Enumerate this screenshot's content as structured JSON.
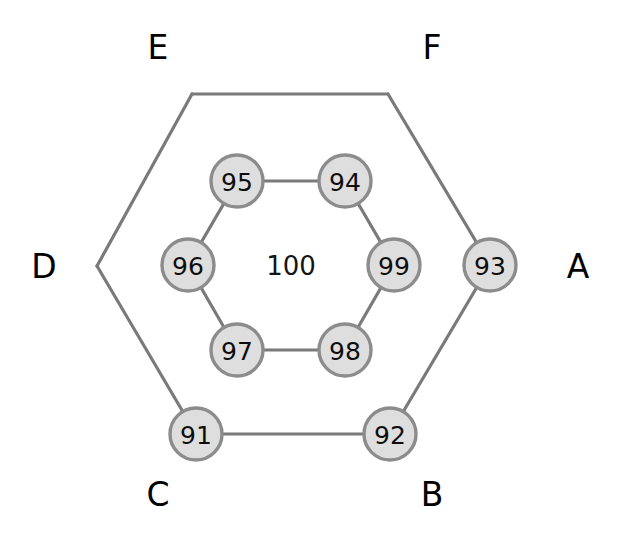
{
  "figure": {
    "title": "",
    "background_color": "#ffffff",
    "node_fill_color": "#dedede",
    "node_stroke_color": "#8c8c8c",
    "edge_color": "#7a7a7a",
    "label_color": "#000000"
  },
  "chart_data": {
    "type": "diagram",
    "layout": "nested-hexagon-graph",
    "title": "",
    "nodes": [
      {
        "id": "n91",
        "label": "91",
        "x": 196,
        "y": 434,
        "r": 26,
        "ring": "outer",
        "vertex": "C"
      },
      {
        "id": "n92",
        "label": "92",
        "x": 390,
        "y": 434,
        "r": 26,
        "ring": "outer",
        "vertex": "B"
      },
      {
        "id": "n93",
        "label": "93",
        "x": 490,
        "y": 265,
        "r": 26,
        "ring": "outer",
        "vertex": "A"
      },
      {
        "id": "n94",
        "label": "94",
        "x": 345,
        "y": 181,
        "r": 26,
        "ring": "inner",
        "vertex": ""
      },
      {
        "id": "n95",
        "label": "95",
        "x": 237,
        "y": 181,
        "r": 26,
        "ring": "inner",
        "vertex": ""
      },
      {
        "id": "n96",
        "label": "96",
        "x": 188,
        "y": 265,
        "r": 26,
        "ring": "inner",
        "vertex": ""
      },
      {
        "id": "n97",
        "label": "97",
        "x": 237,
        "y": 350,
        "r": 26,
        "ring": "inner",
        "vertex": ""
      },
      {
        "id": "n98",
        "label": "98",
        "x": 345,
        "y": 350,
        "r": 26,
        "ring": "inner",
        "vertex": ""
      },
      {
        "id": "n99",
        "label": "99",
        "x": 394,
        "y": 265,
        "r": 26,
        "ring": "inner",
        "vertex": ""
      }
    ],
    "center_node": {
      "id": "n100",
      "label": "100",
      "x": 291,
      "y": 266,
      "has_circle": false
    },
    "outer_vertices": [
      {
        "name": "A",
        "x": 490,
        "y": 265,
        "has_node": true
      },
      {
        "name": "B",
        "x": 390,
        "y": 434,
        "has_node": true
      },
      {
        "name": "C",
        "x": 196,
        "y": 434,
        "has_node": true
      },
      {
        "name": "D",
        "x": 97,
        "y": 266,
        "has_node": false
      },
      {
        "name": "E",
        "x": 192,
        "y": 94,
        "has_node": false
      },
      {
        "name": "F",
        "x": 388,
        "y": 94,
        "has_node": false
      }
    ],
    "corner_labels": [
      {
        "text": "A",
        "x": 578,
        "y": 266
      },
      {
        "text": "B",
        "x": 432,
        "y": 494
      },
      {
        "text": "C",
        "x": 158,
        "y": 494
      },
      {
        "text": "D",
        "x": 44,
        "y": 266
      },
      {
        "text": "E",
        "x": 158,
        "y": 47
      },
      {
        "text": "F",
        "x": 432,
        "y": 47
      }
    ],
    "outer_edges": [
      {
        "from": "A",
        "to": "B",
        "x1": 490,
        "y1": 265,
        "x2": 390,
        "y2": 434
      },
      {
        "from": "B",
        "to": "C",
        "x1": 390,
        "y1": 434,
        "x2": 196,
        "y2": 434
      },
      {
        "from": "C",
        "to": "D",
        "x1": 196,
        "y1": 434,
        "x2": 97,
        "y2": 266
      },
      {
        "from": "D",
        "to": "E",
        "x1": 97,
        "y1": 266,
        "x2": 192,
        "y2": 94
      },
      {
        "from": "E",
        "to": "F",
        "x1": 192,
        "y1": 94,
        "x2": 388,
        "y2": 94
      },
      {
        "from": "F",
        "to": "A",
        "x1": 388,
        "y1": 94,
        "x2": 490,
        "y2": 265
      }
    ],
    "inner_edges": [
      {
        "from": "95",
        "to": "94",
        "x1": 237,
        "y1": 181,
        "x2": 345,
        "y2": 181
      },
      {
        "from": "94",
        "to": "99",
        "x1": 345,
        "y1": 181,
        "x2": 394,
        "y2": 265
      },
      {
        "from": "99",
        "to": "98",
        "x1": 394,
        "y1": 265,
        "x2": 345,
        "y2": 350
      },
      {
        "from": "98",
        "to": "97",
        "x1": 345,
        "y1": 350,
        "x2": 237,
        "y2": 350
      },
      {
        "from": "97",
        "to": "96",
        "x1": 237,
        "y1": 350,
        "x2": 188,
        "y2": 265
      },
      {
        "from": "96",
        "to": "95",
        "x1": 188,
        "y1": 265,
        "x2": 237,
        "y2": 181
      }
    ]
  }
}
